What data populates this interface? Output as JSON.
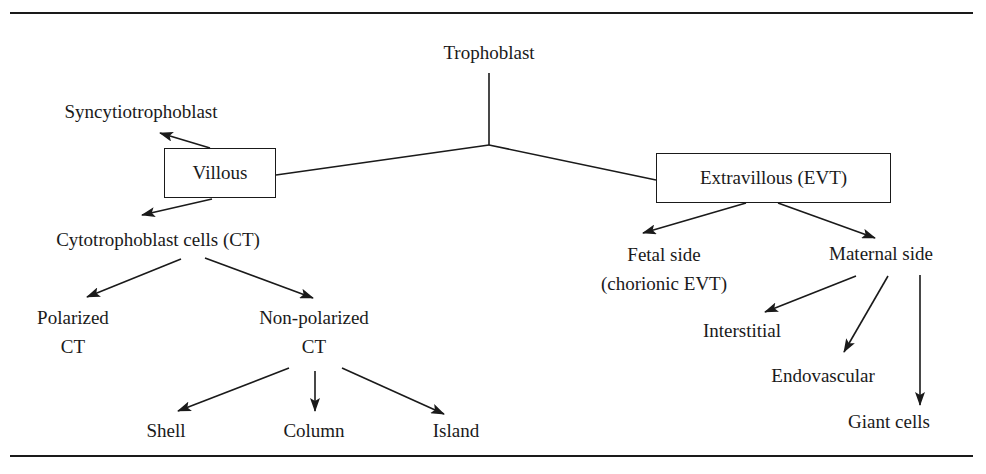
{
  "diagram": {
    "root": {
      "label": "Trophoblast"
    },
    "villous": {
      "label": "Villous",
      "children": {
        "syncytio": {
          "label": "Syncytiotrophoblast"
        },
        "cyto": {
          "label": "Cytotrophoblast cells (CT)",
          "children": {
            "polarized": {
              "line1": "Polarized",
              "line2": "CT"
            },
            "non_polarized": {
              "line1": "Non-polarized",
              "line2": "CT",
              "children": [
                {
                  "label": "Shell"
                },
                {
                  "label": "Column"
                },
                {
                  "label": "Island"
                }
              ]
            }
          }
        }
      }
    },
    "extravillous": {
      "label": "Extravillous (EVT)",
      "children": {
        "fetal": {
          "line1": "Fetal side",
          "line2": "(chorionic EVT)"
        },
        "maternal": {
          "label": "Maternal side",
          "children": [
            {
              "label": "Interstitial"
            },
            {
              "label": "Endovascular"
            },
            {
              "label": "Giant cells"
            }
          ]
        }
      }
    }
  },
  "colors": {
    "ink": "#1a1a1a",
    "background": "#ffffff"
  }
}
